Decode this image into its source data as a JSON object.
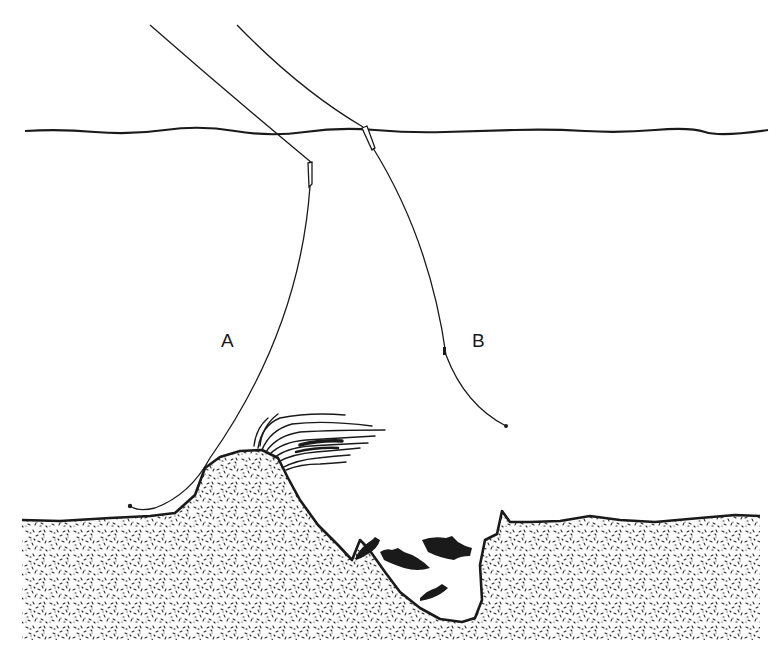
{
  "figure": {
    "type": "line-illustration",
    "colors": {
      "ink": "#1a1a1a",
      "paper": "#ffffff",
      "stipple": "#2a2a2a"
    },
    "elements": {
      "water_surface": "wavy-surface-line",
      "line_a": {
        "label": "A",
        "float": "quill-float",
        "rig": "line running down onto mound top, lying along bottom"
      },
      "line_b": {
        "label": "B",
        "float": "quill-float",
        "rig": "line hanging in mid-water with shot"
      },
      "lake_bed": "stippled-sediment",
      "weed": "weed-bed-on-mound",
      "fish_count": 4
    }
  },
  "labels": {
    "a": "A",
    "b": "B"
  },
  "caption": {
    "text": ""
  }
}
